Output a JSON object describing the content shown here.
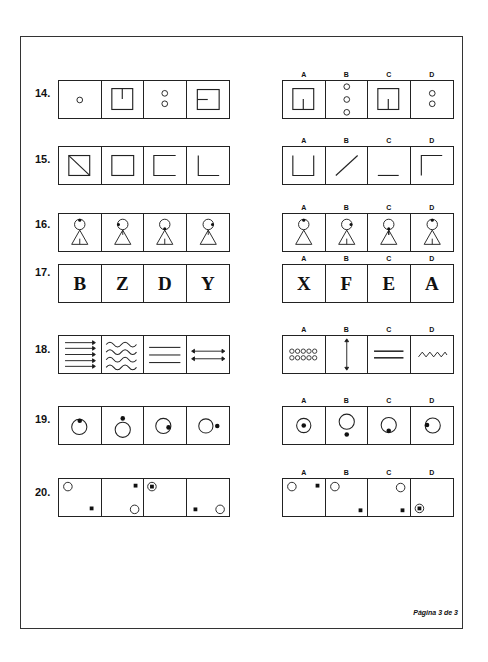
{
  "page": {
    "footer": "Página 3 de 3"
  },
  "option_labels": [
    "A",
    "B",
    "C",
    "D"
  ],
  "questions": [
    {
      "number": "14.",
      "sequence": [
        "one small circle",
        "square with vertical line from top",
        "two small circles stacked",
        "square with horizontal line from left"
      ],
      "options": [
        "square with vertical line from bottom",
        "three small circles stacked",
        "square with vertical line from bottom",
        "two small circles stacked"
      ]
    },
    {
      "number": "15.",
      "sequence": [
        "square with diagonal",
        "square",
        "square missing right side",
        "L shape"
      ],
      "options": [
        "U shape",
        "diagonal line",
        "horizontal line",
        "inverted L shape"
      ]
    },
    {
      "number": "16.",
      "sequence": [
        "figure dot top, stem bottom",
        "figure dot left, stem top",
        "figure dot bottom, stem bottom",
        "figure dot right, stem top"
      ],
      "options": [
        "figure dot top, no stem",
        "figure dot right, stem bottom",
        "figure dot bottom, stem top",
        "figure dot top, stem bottom"
      ]
    },
    {
      "number": "17.",
      "sequence": [
        "B",
        "Z",
        "D",
        "Y"
      ],
      "options": [
        "X",
        "F",
        "E",
        "A"
      ]
    },
    {
      "number": "18.",
      "sequence": [
        "five right arrows",
        "four wavy lines",
        "three straight lines",
        "two double arrows"
      ],
      "options": [
        "ten small circles",
        "vertical double arrow",
        "two straight lines",
        "zigzag line"
      ]
    },
    {
      "number": "19.",
      "sequence": [
        "circle dot inside top",
        "circle dot outside top",
        "circle dot inside right",
        "circle dot outside right"
      ],
      "options": [
        "circle dot center",
        "circle dot outside bottom",
        "circle dot inside bottom",
        "circle dot inside left"
      ]
    },
    {
      "number": "20.",
      "sequence": [
        "circle top-left, square bottom-right",
        "square top-right, circle bottom-right",
        "circle containing square top-left",
        "square bottom-left, circle bottom-right"
      ],
      "options": [
        "circle top-left, square top-right",
        "circle top-left, square bottom-right",
        "circle top-right, square bottom-right",
        "circle containing square bottom-left"
      ]
    }
  ]
}
